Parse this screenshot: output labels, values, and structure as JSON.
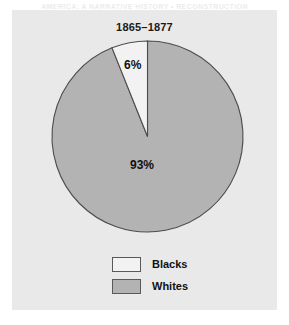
{
  "running_head": "AMERICA: A NARRATIVE HISTORY  •  RECONSTRUCTION",
  "panel": {
    "title": "1865–1877"
  },
  "legend": {
    "position": "bottom-center",
    "items": [
      {
        "label": "Blacks",
        "color": "#f2f2f2",
        "swatch": "legend-swatch-light"
      },
      {
        "label": "Whites",
        "color": "#b3b3b3",
        "swatch": "legend-swatch-gray"
      }
    ]
  },
  "colors": {
    "panel_background": "#e9e9e9",
    "page_background": "#ffffff",
    "slice_blacks": "#f2f2f2",
    "slice_whites": "#b3b3b3",
    "outline": "#4d4d4d",
    "text": "#111111"
  },
  "chart_data": {
    "type": "pie",
    "title": "1865–1877",
    "xlabel": "",
    "ylabel": "",
    "grid": false,
    "legend": "bottom-center",
    "start_angle_deg": 90,
    "direction": "counterclockwise",
    "units": "percent",
    "labels": [
      "Blacks",
      "Whites"
    ],
    "values": [
      6,
      93
    ],
    "data_labels": [
      "6%",
      "93%"
    ],
    "slices": [
      {
        "name": "Blacks",
        "value": 6,
        "data_label": "6%",
        "color": "#f2f2f2",
        "sweep_deg": 21.6
      },
      {
        "name": "Whites",
        "value": 93,
        "data_label": "93%",
        "color": "#b3b3b3",
        "sweep_deg": 338.4
      }
    ]
  }
}
